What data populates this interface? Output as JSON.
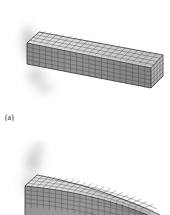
{
  "figure": {
    "background_color": "#ffffff",
    "panels": [
      {
        "id": "a",
        "caption": "(a)",
        "description": "undeformed-meshed-cantilever-beam",
        "state": "undeformed",
        "mesh": {
          "length_divisions": 20,
          "height_divisions": 5,
          "depth_divisions": 4,
          "line_color": "#3f3f3f",
          "front_face_color": "#8d8d8d",
          "top_face_color": "#d9d9d9",
          "end_face_color": "#b4b4b4"
        },
        "shadow": {
          "color": "#9a9a9a",
          "position": "behind-left-fixed-end"
        }
      },
      {
        "id": "b",
        "caption": "",
        "description": "deformed-bent-cantilever-beam",
        "state": "deformed",
        "clipped": "bottom-edge-of-image",
        "mesh": {
          "length_divisions": 20,
          "height_divisions": 5,
          "depth_divisions": 4,
          "line_color": "#4a4a4a",
          "front_face_color": "#969696",
          "top_face_color": "#dcdcdc",
          "end_face_color": "#bcbcbc"
        },
        "shadow": {
          "color": "#a5a5a5",
          "position": "behind-left-fixed-end"
        }
      }
    ]
  },
  "colors": {
    "page_background": "#ffffff",
    "ink": "#1a1a1a",
    "mesh_light": "#d9d9d9",
    "mesh_mid": "#8d8d8d",
    "mesh_dark": "#3f3f3f",
    "shadow": "#9a9a9a"
  }
}
